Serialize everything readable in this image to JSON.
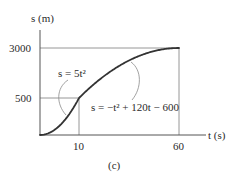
{
  "chart_data": {
    "type": "line",
    "title": "",
    "caption": "(c)",
    "xlabel": "t (s)",
    "ylabel": "s (m)",
    "x_ticks": [
      10,
      60
    ],
    "y_ticks": [
      500,
      3000
    ],
    "xlim": [
      0,
      70
    ],
    "ylim": [
      0,
      3400
    ],
    "grid": false,
    "legend": "none",
    "series": [
      {
        "name": "s = 5t²",
        "equation": "s = 5t^2",
        "domain": [
          0,
          10
        ],
        "x": [
          0,
          2,
          4,
          6,
          8,
          10
        ],
        "values": [
          0,
          20,
          80,
          180,
          320,
          500
        ]
      },
      {
        "name": "s = −t² + 120t − 600",
        "equation": "s = -t^2 + 120t - 600",
        "domain": [
          10,
          60
        ],
        "x": [
          10,
          20,
          30,
          40,
          50,
          60
        ],
        "values": [
          500,
          1400,
          2100,
          2600,
          2900,
          3000
        ]
      }
    ],
    "reference_lines": [
      {
        "type": "horizontal",
        "y": 3000,
        "from_t": 0,
        "to_t": 60
      },
      {
        "type": "horizontal",
        "y": 500,
        "from_t": 0,
        "to_t": 10
      },
      {
        "type": "vertical",
        "x": 10,
        "from_s": 0,
        "to_s": 500
      },
      {
        "type": "vertical",
        "x": 60,
        "from_s": 0,
        "to_s": 3000
      }
    ],
    "annotations": [
      {
        "text": "s = 5t²",
        "points_to": "segment t 0-10"
      },
      {
        "text": "s = −t² + 120t − 600",
        "points_to": "segment t 10-60"
      }
    ]
  },
  "labels": {
    "y_axis": "s (m)",
    "x_axis": "t (s)",
    "y_tick_3000": "3000",
    "y_tick_500": "500",
    "x_tick_10": "10",
    "x_tick_60": "60",
    "eq1": "s = 5t²",
    "eq2": "s = −t² + 120t − 600",
    "caption": "(c)"
  },
  "colors": {
    "curve": "#333333",
    "axis": "#555555",
    "guide": "#8a8a8a",
    "text": "#2b2b2b"
  }
}
